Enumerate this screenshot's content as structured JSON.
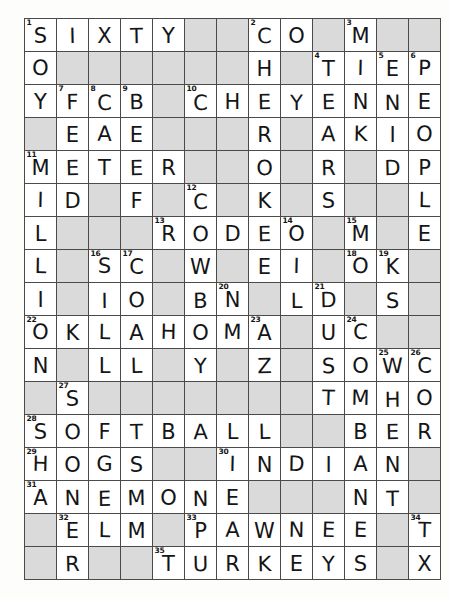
{
  "puzzle": {
    "type": "crossword-grid",
    "rows": 17,
    "cols": 13,
    "cell_size_px": 32,
    "colors": {
      "cell_fill": "#ffffff",
      "block_fill": "#8d8d8d",
      "grid_line": "#4a4a4a",
      "border": "#1a1a1a",
      "text": "#151515",
      "page_background": "#fdfdfb"
    },
    "legend": {
      "block": "#",
      "empty_letter": ""
    },
    "grid": [
      [
        {
          "n": "1",
          "l": "S"
        },
        {
          "n": "",
          "l": "I"
        },
        {
          "n": "",
          "l": "X"
        },
        {
          "n": "",
          "l": "T"
        },
        {
          "n": "",
          "l": "Y"
        },
        {
          "n": "",
          "l": "#"
        },
        {
          "n": "",
          "l": "#"
        },
        {
          "n": "2",
          "l": "C"
        },
        {
          "n": "",
          "l": "O"
        },
        {
          "n": "",
          "l": "#"
        },
        {
          "n": "3",
          "l": "M"
        },
        {
          "n": "",
          "l": "#"
        },
        {
          "n": "",
          "l": "#"
        }
      ],
      [
        {
          "n": "",
          "l": "O"
        },
        {
          "n": "",
          "l": "#"
        },
        {
          "n": "",
          "l": "#"
        },
        {
          "n": "",
          "l": "#"
        },
        {
          "n": "",
          "l": "#"
        },
        {
          "n": "",
          "l": "#"
        },
        {
          "n": "",
          "l": "#"
        },
        {
          "n": "",
          "l": "H"
        },
        {
          "n": "",
          "l": "#"
        },
        {
          "n": "4",
          "l": "T"
        },
        {
          "n": "",
          "l": "I"
        },
        {
          "n": "5",
          "l": "E"
        },
        {
          "n": "6",
          "l": "P"
        }
      ],
      [
        {
          "n": "",
          "l": "Y"
        },
        {
          "n": "7",
          "l": "F"
        },
        {
          "n": "8",
          "l": "C"
        },
        {
          "n": "9",
          "l": "B"
        },
        {
          "n": "",
          "l": "#"
        },
        {
          "n": "10",
          "l": "C"
        },
        {
          "n": "",
          "l": "H"
        },
        {
          "n": "",
          "l": "E"
        },
        {
          "n": "",
          "l": "Y"
        },
        {
          "n": "",
          "l": "E"
        },
        {
          "n": "",
          "l": "N"
        },
        {
          "n": "",
          "l": "N"
        },
        {
          "n": "",
          "l": "E"
        }
      ],
      [
        {
          "n": "",
          "l": "#"
        },
        {
          "n": "",
          "l": "E"
        },
        {
          "n": "",
          "l": "A"
        },
        {
          "n": "",
          "l": "E"
        },
        {
          "n": "",
          "l": "#"
        },
        {
          "n": "",
          "l": "#"
        },
        {
          "n": "",
          "l": "#"
        },
        {
          "n": "",
          "l": "R"
        },
        {
          "n": "",
          "l": "#"
        },
        {
          "n": "",
          "l": "A"
        },
        {
          "n": "",
          "l": "K"
        },
        {
          "n": "",
          "l": "I"
        },
        {
          "n": "",
          "l": "O"
        }
      ],
      [
        {
          "n": "11",
          "l": "M"
        },
        {
          "n": "",
          "l": "E"
        },
        {
          "n": "",
          "l": "T"
        },
        {
          "n": "",
          "l": "E"
        },
        {
          "n": "",
          "l": "R"
        },
        {
          "n": "",
          "l": "#"
        },
        {
          "n": "",
          "l": "#"
        },
        {
          "n": "",
          "l": "O"
        },
        {
          "n": "",
          "l": "#"
        },
        {
          "n": "",
          "l": "R"
        },
        {
          "n": "",
          "l": "#"
        },
        {
          "n": "",
          "l": "D"
        },
        {
          "n": "",
          "l": "P"
        }
      ],
      [
        {
          "n": "",
          "l": "I"
        },
        {
          "n": "",
          "l": "D"
        },
        {
          "n": "",
          "l": "#"
        },
        {
          "n": "",
          "l": "F"
        },
        {
          "n": "",
          "l": "#"
        },
        {
          "n": "12",
          "l": "C"
        },
        {
          "n": "",
          "l": "#"
        },
        {
          "n": "",
          "l": "K"
        },
        {
          "n": "",
          "l": "#"
        },
        {
          "n": "",
          "l": "S"
        },
        {
          "n": "",
          "l": "#"
        },
        {
          "n": "",
          "l": "#"
        },
        {
          "n": "",
          "l": "L"
        }
      ],
      [
        {
          "n": "",
          "l": "L"
        },
        {
          "n": "",
          "l": "#"
        },
        {
          "n": "",
          "l": "#"
        },
        {
          "n": "",
          "l": "#"
        },
        {
          "n": "13",
          "l": "R"
        },
        {
          "n": "",
          "l": "O"
        },
        {
          "n": "",
          "l": "D"
        },
        {
          "n": "",
          "l": "E"
        },
        {
          "n": "14",
          "l": "O"
        },
        {
          "n": "",
          "l": "#"
        },
        {
          "n": "15",
          "l": "M"
        },
        {
          "n": "",
          "l": "#"
        },
        {
          "n": "",
          "l": "E"
        }
      ],
      [
        {
          "n": "",
          "l": "L"
        },
        {
          "n": "",
          "l": "#"
        },
        {
          "n": "16",
          "l": "S"
        },
        {
          "n": "17",
          "l": "C"
        },
        {
          "n": "",
          "l": "#"
        },
        {
          "n": "",
          "l": "W"
        },
        {
          "n": "",
          "l": "#"
        },
        {
          "n": "",
          "l": "E"
        },
        {
          "n": "",
          "l": "I"
        },
        {
          "n": "",
          "l": "#"
        },
        {
          "n": "18",
          "l": "O"
        },
        {
          "n": "19",
          "l": "K"
        },
        {
          "n": "",
          "l": "#"
        }
      ],
      [
        {
          "n": "",
          "l": "I"
        },
        {
          "n": "",
          "l": "#"
        },
        {
          "n": "",
          "l": "I"
        },
        {
          "n": "",
          "l": "O"
        },
        {
          "n": "",
          "l": "#"
        },
        {
          "n": "",
          "l": "B"
        },
        {
          "n": "20",
          "l": "N"
        },
        {
          "n": "",
          "l": "#"
        },
        {
          "n": "",
          "l": "L"
        },
        {
          "n": "21",
          "l": "D"
        },
        {
          "n": "",
          "l": "#"
        },
        {
          "n": "",
          "l": "S"
        },
        {
          "n": "",
          "l": "#"
        }
      ],
      [
        {
          "n": "22",
          "l": "O"
        },
        {
          "n": "",
          "l": "K"
        },
        {
          "n": "",
          "l": "L"
        },
        {
          "n": "",
          "l": "A"
        },
        {
          "n": "",
          "l": "H"
        },
        {
          "n": "",
          "l": "O"
        },
        {
          "n": "",
          "l": "M"
        },
        {
          "n": "23",
          "l": "A"
        },
        {
          "n": "",
          "l": "#"
        },
        {
          "n": "",
          "l": "U"
        },
        {
          "n": "24",
          "l": "C"
        },
        {
          "n": "",
          "l": "#"
        },
        {
          "n": "",
          "l": "#"
        }
      ],
      [
        {
          "n": "",
          "l": "N"
        },
        {
          "n": "",
          "l": "#"
        },
        {
          "n": "",
          "l": "L"
        },
        {
          "n": "",
          "l": "L"
        },
        {
          "n": "",
          "l": "#"
        },
        {
          "n": "",
          "l": "Y"
        },
        {
          "n": "",
          "l": "#"
        },
        {
          "n": "",
          "l": "Z"
        },
        {
          "n": "",
          "l": "#"
        },
        {
          "n": "",
          "l": "S"
        },
        {
          "n": "",
          "l": "O"
        },
        {
          "n": "25",
          "l": "W"
        },
        {
          "n": "26",
          "l": "C"
        }
      ],
      [
        {
          "n": "",
          "l": "#"
        },
        {
          "n": "27",
          "l": "S"
        },
        {
          "n": "",
          "l": "#"
        },
        {
          "n": "",
          "l": "#"
        },
        {
          "n": "",
          "l": "#"
        },
        {
          "n": "",
          "l": "#"
        },
        {
          "n": "",
          "l": "#"
        },
        {
          "n": "",
          "l": "#"
        },
        {
          "n": "",
          "l": "#"
        },
        {
          "n": "",
          "l": "T"
        },
        {
          "n": "",
          "l": "M"
        },
        {
          "n": "",
          "l": "H"
        },
        {
          "n": "",
          "l": "O"
        }
      ],
      [
        {
          "n": "28",
          "l": "S"
        },
        {
          "n": "",
          "l": "O"
        },
        {
          "n": "",
          "l": "F"
        },
        {
          "n": "",
          "l": "T"
        },
        {
          "n": "",
          "l": "B"
        },
        {
          "n": "",
          "l": "A"
        },
        {
          "n": "",
          "l": "L"
        },
        {
          "n": "",
          "l": "L"
        },
        {
          "n": "",
          "l": "#"
        },
        {
          "n": "",
          "l": "#"
        },
        {
          "n": "",
          "l": "B"
        },
        {
          "n": "",
          "l": "E"
        },
        {
          "n": "",
          "l": "R"
        }
      ],
      [
        {
          "n": "29",
          "l": "H"
        },
        {
          "n": "",
          "l": "O"
        },
        {
          "n": "",
          "l": "G"
        },
        {
          "n": "",
          "l": "S"
        },
        {
          "n": "",
          "l": "#"
        },
        {
          "n": "",
          "l": "#"
        },
        {
          "n": "30",
          "l": "I"
        },
        {
          "n": "",
          "l": "N"
        },
        {
          "n": "",
          "l": "D"
        },
        {
          "n": "",
          "l": "I"
        },
        {
          "n": "",
          "l": "A"
        },
        {
          "n": "",
          "l": "N"
        },
        {
          "n": "",
          "l": "#"
        }
      ],
      [
        {
          "n": "31",
          "l": "A"
        },
        {
          "n": "",
          "l": "N"
        },
        {
          "n": "",
          "l": "E"
        },
        {
          "n": "",
          "l": "M"
        },
        {
          "n": "",
          "l": "O"
        },
        {
          "n": "",
          "l": "N"
        },
        {
          "n": "",
          "l": "E"
        },
        {
          "n": "",
          "l": "#"
        },
        {
          "n": "",
          "l": "#"
        },
        {
          "n": "",
          "l": "#"
        },
        {
          "n": "",
          "l": "N"
        },
        {
          "n": "",
          "l": "T"
        },
        {
          "n": "",
          "l": "#"
        }
      ],
      [
        {
          "n": "",
          "l": "#"
        },
        {
          "n": "32",
          "l": "E"
        },
        {
          "n": "",
          "l": "L"
        },
        {
          "n": "",
          "l": "M"
        },
        {
          "n": "",
          "l": "#"
        },
        {
          "n": "33",
          "l": "P"
        },
        {
          "n": "",
          "l": "A"
        },
        {
          "n": "",
          "l": "W"
        },
        {
          "n": "",
          "l": "N"
        },
        {
          "n": "",
          "l": "E"
        },
        {
          "n": "",
          "l": "E"
        },
        {
          "n": "",
          "l": "#"
        },
        {
          "n": "34",
          "l": "T"
        }
      ],
      [
        {
          "n": "",
          "l": "#"
        },
        {
          "n": "",
          "l": "R"
        },
        {
          "n": "",
          "l": "#"
        },
        {
          "n": "",
          "l": "#"
        },
        {
          "n": "35",
          "l": "T"
        },
        {
          "n": "",
          "l": "U"
        },
        {
          "n": "",
          "l": "R"
        },
        {
          "n": "",
          "l": "K"
        },
        {
          "n": "",
          "l": "E"
        },
        {
          "n": "",
          "l": "Y"
        },
        {
          "n": "",
          "l": "S"
        },
        {
          "n": "",
          "l": "#"
        },
        {
          "n": "",
          "l": "X"
        }
      ]
    ],
    "across_answers": [
      "SIXTY",
      "CO",
      "TIEP",
      "CHEYENNE",
      "METER",
      "RODEO",
      "OKLAHOMA",
      "SOFTBALL",
      "HOGS",
      "INDIAN",
      "ANEMONE",
      "ELM",
      "PAWNEE",
      "TURKEYS"
    ],
    "down_answers": [
      "SOY",
      "MILLION",
      "CHOCKS",
      "FEDS",
      "CAL",
      "BEEF",
      "CROOKS",
      "TARS",
      "EIDER",
      "PEOPLE",
      "MOK",
      "SIO",
      "OWN",
      "DID",
      "SOFTBALL"
    ]
  }
}
